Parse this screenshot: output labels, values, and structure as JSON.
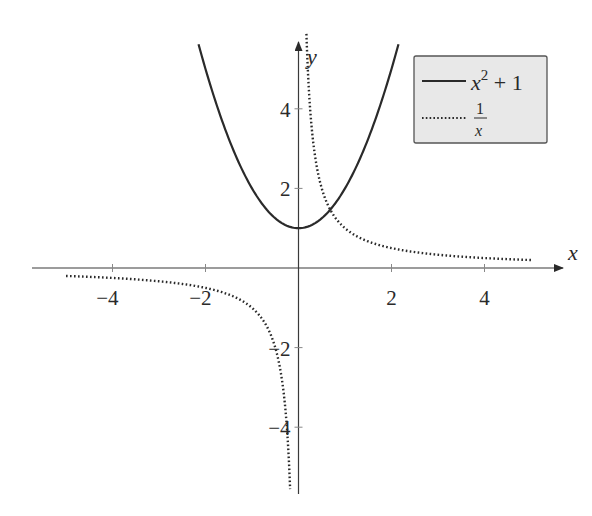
{
  "chart_data": {
    "type": "line",
    "title": "",
    "xlabel": "x",
    "ylabel": "y",
    "xlim": [
      -5.3,
      5.6
    ],
    "ylim": [
      -5.7,
      5.9
    ],
    "grid": false,
    "legend_position": "upper right",
    "x_ticks": [
      -4,
      -2,
      2,
      4
    ],
    "y_ticks": [
      -4,
      -2,
      2,
      4
    ],
    "x_tick_labels": [
      "−4",
      "−2",
      "2",
      "4"
    ],
    "y_tick_labels": [
      "−4",
      "−2",
      "2",
      "4"
    ],
    "series": [
      {
        "name": "x^2 + 1",
        "style": "solid",
        "domain": [
          -2.15,
          2.15
        ],
        "x": [
          -2.15,
          -2,
          -1.5,
          -1,
          -0.5,
          0,
          0.5,
          1,
          1.5,
          2,
          2.15
        ],
        "y": [
          5.62,
          5,
          3.25,
          2,
          1.25,
          1,
          1.25,
          2,
          3.25,
          5,
          5.62
        ]
      },
      {
        "name": "1/x",
        "style": "dotted",
        "domain": [
          [
            -5,
            -0.18
          ],
          [
            0.17,
            5
          ]
        ],
        "x": [
          -5,
          -4,
          -3,
          -2,
          -1,
          -0.5,
          -0.25,
          -0.18,
          0.17,
          0.25,
          0.5,
          1,
          2,
          3,
          4,
          5
        ],
        "y": [
          -0.2,
          -0.25,
          -0.33,
          -0.5,
          -1,
          -2,
          -4,
          -5.5,
          5.9,
          4,
          2,
          1,
          0.5,
          0.33,
          0.25,
          0.2
        ]
      }
    ]
  },
  "axes": {
    "x_label": "x",
    "y_label": "y",
    "ticks": {
      "x": [
        {
          "v": -4,
          "label": "−4"
        },
        {
          "v": -2,
          "label": "−2"
        },
        {
          "v": 2,
          "label": "2"
        },
        {
          "v": 4,
          "label": "4"
        }
      ],
      "y": [
        {
          "v": -4,
          "label": "−4"
        },
        {
          "v": -2,
          "label": "−2"
        },
        {
          "v": 2,
          "label": "2"
        },
        {
          "v": 4,
          "label": "4"
        }
      ]
    }
  },
  "legend": {
    "entries": [
      {
        "label_base": "x",
        "label_sup": "2",
        "label_rest": " + 1",
        "style": "solid"
      },
      {
        "label_num": "1",
        "label_den": "x",
        "style": "dotted"
      }
    ],
    "background": "#e8e8e8",
    "border": "#555555"
  },
  "colors": {
    "line": "#2a2a2a",
    "axis": "#3a3a3a"
  }
}
